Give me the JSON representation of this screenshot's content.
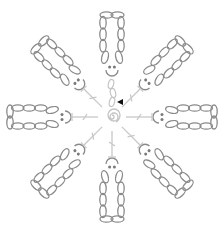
{
  "diagram": {
    "type": "crochet-chart",
    "title": "",
    "colors": {
      "background": "#ffffff",
      "petal_stroke": "#8a8a8a",
      "slip_stitch_dots": "#7a7a7a",
      "spoke_stroke": "#c8c8c8",
      "center_stroke": "#c4c4c4",
      "start_marker": "#111111"
    },
    "center": {
      "x": 112,
      "y": 117
    },
    "petal_count": 8,
    "petal_angles_deg": [
      270,
      315,
      0,
      45,
      90,
      135,
      180,
      225
    ],
    "petal": {
      "chain_ovals_per_side": 4,
      "loop_tip_ovals": 2,
      "loop_length": 56,
      "loop_width": 24,
      "loop_inner_radius": 48
    },
    "spoke": {
      "start_radius": 14,
      "end_radius": 40,
      "tick_radius": 27,
      "bar_half_width": 4
    },
    "start_chain": {
      "ovals": 3,
      "marker": "start-arrow"
    },
    "legend": []
  }
}
